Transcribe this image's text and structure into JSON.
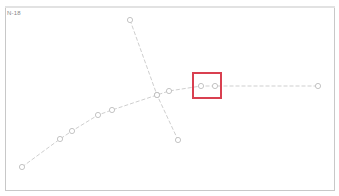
{
  "view": {
    "label": "N-18"
  },
  "colors": {
    "line": "#cfcfcf",
    "node": "#bdbdbd",
    "highlight": "#d94050",
    "frame": "#c8c8c8"
  },
  "paths": {
    "main_curve": [
      [
        22,
        167
      ],
      [
        60,
        139
      ],
      [
        72,
        131
      ],
      [
        98,
        115
      ],
      [
        112,
        110
      ],
      [
        157,
        95
      ],
      [
        169,
        91
      ],
      [
        201,
        86
      ],
      [
        215,
        86
      ],
      [
        318,
        86
      ]
    ],
    "cross_line": [
      [
        130,
        20
      ],
      [
        157,
        95
      ],
      [
        178,
        140
      ]
    ]
  },
  "highlight": {
    "x": 192,
    "y": 72,
    "width": 30,
    "height": 27
  }
}
